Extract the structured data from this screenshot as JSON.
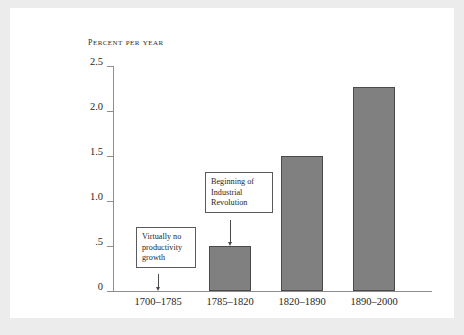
{
  "chart_data": {
    "type": "bar",
    "title": "Percent per year",
    "xlabel": "",
    "ylabel": "Percent per year",
    "categories": [
      "1700–1785",
      "1785–1820",
      "1820–1890",
      "1890–2000"
    ],
    "values": [
      0,
      0.5,
      1.5,
      2.27
    ],
    "ylim": [
      0,
      2.5
    ],
    "ytick_labels": [
      "2.5",
      "2.0",
      "1.5",
      "1.0",
      ".5",
      "0"
    ],
    "ytick_values": [
      2.5,
      2.0,
      1.5,
      1.0,
      0.5,
      0
    ],
    "grid": false,
    "legend": false,
    "bar_color": "#808080",
    "bar_border_color": "#4a4a4a",
    "axis_color": "#8d8d8d",
    "annotations": [
      {
        "text": "Virtually no productivity growth",
        "lines": [
          "Virtually no",
          "productivity",
          "growth"
        ],
        "points_to_category": "1700–1785",
        "points_to_value": 0
      },
      {
        "text": "Beginning of Industrial Revolution",
        "lines": [
          "Beginning of",
          "Industrial",
          "Revolution"
        ],
        "points_to_category": "1785–1820",
        "points_to_value": 0.5
      }
    ]
  }
}
